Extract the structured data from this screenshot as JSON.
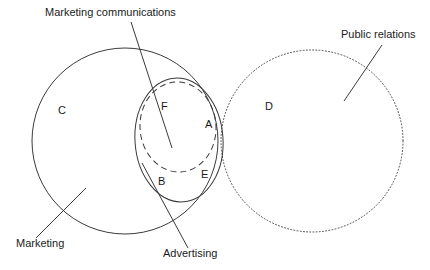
{
  "diagram": {
    "background_color": "#ffffff",
    "stroke_color": "#3a3a3a",
    "text_color": "#1b1b1b",
    "callouts": [
      {
        "key": "marketing_communications",
        "text": "Marketing communications",
        "text_x": 45,
        "text_y": 16,
        "line_x1": 131,
        "line_y1": 22,
        "line_x2": 172,
        "line_y2": 148
      },
      {
        "key": "public_relations",
        "text": "Public relations",
        "text_x": 341,
        "text_y": 38,
        "line_x1": 382,
        "line_y1": 45,
        "line_x2": 344,
        "line_y2": 101
      },
      {
        "key": "marketing",
        "text": "Marketing",
        "text_x": 16,
        "text_y": 247,
        "line_x1": 36,
        "line_y1": 238,
        "line_x2": 86,
        "line_y2": 188
      },
      {
        "key": "advertising",
        "text": "Advertising",
        "text_x": 163,
        "text_y": 257,
        "line_x1": 188,
        "line_y1": 248,
        "line_x2": 142,
        "line_y2": 163
      }
    ],
    "region_labels": [
      {
        "key": "C",
        "text": "C",
        "x": 58,
        "y": 114
      },
      {
        "key": "F",
        "text": "F",
        "x": 161,
        "y": 110
      },
      {
        "key": "A",
        "text": "A",
        "x": 205,
        "y": 128
      },
      {
        "key": "D",
        "text": "D",
        "x": 265,
        "y": 110
      },
      {
        "key": "B",
        "text": "B",
        "x": 158,
        "y": 185
      },
      {
        "key": "E",
        "text": "E",
        "x": 201,
        "y": 178
      }
    ],
    "shapes": [
      {
        "key": "marketing_circle",
        "name": "marketing-circle",
        "style": "solid",
        "type": "circle",
        "cx": 125,
        "cy": 141,
        "r": 93
      },
      {
        "key": "public_relations_circle",
        "name": "public-relations-circle",
        "style": "dotted",
        "type": "circle",
        "cx": 312,
        "cy": 141,
        "r": 91
      },
      {
        "key": "marketing_communications_ellipse",
        "name": "marketing-communications-ellipse",
        "style": "solid",
        "type": "ellipse",
        "cx": 179,
        "cy": 140,
        "rx": 44,
        "ry": 62,
        "rotation": -4
      },
      {
        "key": "advertising_ellipse",
        "name": "advertising-ellipse",
        "style": "dashed",
        "type": "ellipse",
        "cx": 178,
        "cy": 127,
        "rx": 38,
        "ry": 45,
        "rotation": -4
      }
    ]
  }
}
